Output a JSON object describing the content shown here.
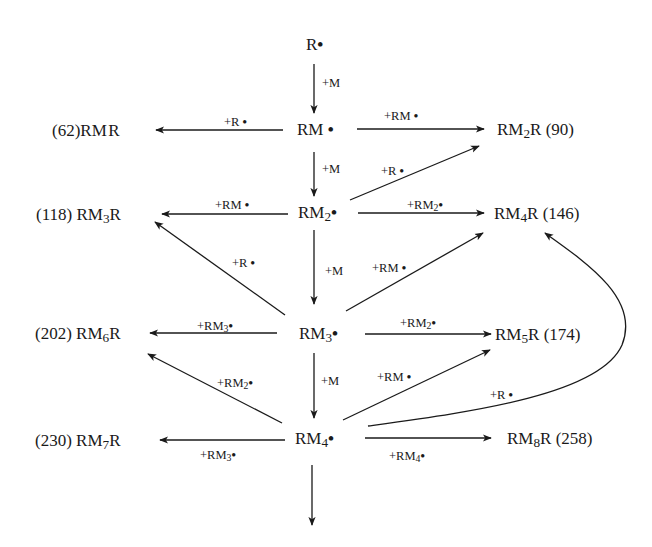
{
  "diagram": {
    "nodes": {
      "r_radical": {
        "text": "R•"
      },
      "rm1": {
        "text": "RM•"
      },
      "rm2": {
        "text": "RM₂•"
      },
      "rm3": {
        "text": "RM₃•"
      },
      "rm4": {
        "text": "RM₄•"
      },
      "rmr": {
        "text": "(62) RMR",
        "mw": 62,
        "species": "RMR"
      },
      "rm2r": {
        "text": "RM₂R (90)",
        "mw": 90,
        "species": "RM2R"
      },
      "rm3r": {
        "text": "(118) RM₃R",
        "mw": 118,
        "species": "RM3R"
      },
      "rm4r": {
        "text": "RM₄R (146)",
        "mw": 146,
        "species": "RM4R"
      },
      "rm6r": {
        "text": "(202) RM₆R",
        "mw": 202,
        "species": "RM6R"
      },
      "rm5r": {
        "text": "RM₅R (174)",
        "mw": 174,
        "species": "RM5R"
      },
      "rm7r": {
        "text": "(230) RM₇R",
        "mw": 230,
        "species": "RM7R"
      },
      "rm8r": {
        "text": "RM₈R (258)",
        "mw": 258,
        "species": "RM8R"
      }
    },
    "edges": [
      {
        "from": "R•",
        "to": "RM•",
        "label": "+M"
      },
      {
        "from": "RM•",
        "to": "RMR",
        "label": "+R•"
      },
      {
        "from": "RM•",
        "to": "RM2R",
        "label": "+RM•"
      },
      {
        "from": "RM•",
        "to": "RM2•",
        "label": "+M"
      },
      {
        "from": "RM2•",
        "to": "RM2R",
        "label": "+R•"
      },
      {
        "from": "RM2•",
        "to": "RM3R",
        "label": "+RM•"
      },
      {
        "from": "RM2•",
        "to": "RM4R",
        "label": "+RM2•"
      },
      {
        "from": "RM2•",
        "to": "RM3•",
        "label": "+M"
      },
      {
        "from": "RM3•",
        "to": "RM3R",
        "label": "+R•"
      },
      {
        "from": "RM3•",
        "to": "RM4R",
        "label": "+RM•"
      },
      {
        "from": "RM3•",
        "to": "RM6R",
        "label": "+RM3•"
      },
      {
        "from": "RM3•",
        "to": "RM5R",
        "label": "+RM2•"
      },
      {
        "from": "RM3•",
        "to": "RM4•",
        "label": "+M"
      },
      {
        "from": "RM4•",
        "to": "RM6R",
        "label": "+RM2•"
      },
      {
        "from": "RM4•",
        "to": "RM5R",
        "label": "+RM•"
      },
      {
        "from": "RM4•",
        "to": "RM4R",
        "label": "+R•"
      },
      {
        "from": "RM4•",
        "to": "RM7R",
        "label": "+RM3•"
      },
      {
        "from": "RM4•",
        "to": "RM8R",
        "label": "+RM4•"
      },
      {
        "from": "RM4•",
        "to": "(continues)",
        "label": ""
      }
    ],
    "labels": {
      "m1": "+M",
      "m2": "+M",
      "m3": "+M",
      "m4": "+M",
      "rm1_to_rmr": "+R",
      "rm1_to_rm2r": "+RM",
      "rm2_to_rm2r": "+R",
      "rm2_to_rm3r": "+RM",
      "rm2_to_rm4r": "+RM",
      "rm3_to_rm3r": "+R",
      "rm3_to_rm4r": "+RM",
      "rm3_to_rm6r": "+RM",
      "rm3_to_rm5r": "+RM",
      "rm4_to_rm6r": "+RM",
      "rm4_to_rm5r": "+RM",
      "rm4_to_rm4r": "+R",
      "rm4_to_rm7r": "+RM",
      "rm4_to_rm8r": "+RM"
    },
    "parts": {
      "R": "R",
      "RM": "RM",
      "dot": "•",
      "sub2": "2",
      "sub3": "3",
      "sub4": "4",
      "sub5": "5",
      "sub6": "6",
      "sub7": "7",
      "sub8": "8",
      "mw62": "(62)",
      "mw90": "(90)",
      "mw118": "(118)",
      "mw146": "(146)",
      "mw174": "(174)",
      "mw202": "(202)",
      "mw230": "(230)",
      "mw258": "(258)"
    },
    "colors": {
      "ink": "#1a1a1a",
      "background": "#ffffff"
    }
  }
}
